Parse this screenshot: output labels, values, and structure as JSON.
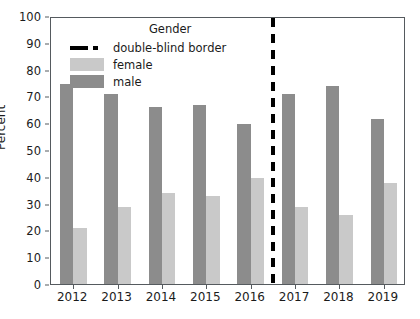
{
  "chart_data": {
    "type": "bar",
    "title": "",
    "xlabel": "",
    "ylabel": "Percent",
    "categories": [
      "2012",
      "2013",
      "2014",
      "2015",
      "2016",
      "2017",
      "2018",
      "2019"
    ],
    "series": [
      {
        "name": "male",
        "color": "#8c8c8c",
        "values": [
          74.8,
          70.9,
          66.0,
          66.9,
          59.8,
          70.8,
          73.7,
          61.7
        ]
      },
      {
        "name": "female",
        "color": "#c9c9c9",
        "values": [
          20.9,
          28.9,
          33.9,
          32.7,
          39.6,
          28.6,
          25.6,
          37.6
        ]
      }
    ],
    "ylim": [
      0,
      100
    ],
    "yticks": [
      0,
      10,
      20,
      30,
      40,
      50,
      60,
      70,
      80,
      90,
      100
    ],
    "grid": false,
    "legend_position": "upper-center-left",
    "legend": {
      "title": "Gender",
      "entries": [
        {
          "label": "double-blind border",
          "style": "dashed-line",
          "color": "#000000"
        },
        {
          "label": "female",
          "style": "swatch-female",
          "color": "#c9c9c9"
        },
        {
          "label": "male",
          "style": "swatch-male",
          "color": "#8c8c8c"
        }
      ]
    },
    "annotations": [
      {
        "name": "double-blind border",
        "type": "vertical-dashed-line",
        "x_between": [
          "2016",
          "2017"
        ],
        "color": "#000000"
      }
    ]
  }
}
